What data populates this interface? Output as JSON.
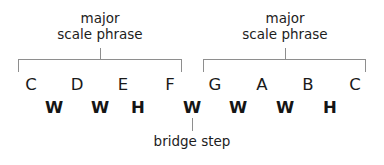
{
  "diagram": {
    "colors": {
      "text": "#1a1a1a",
      "line": "#8e8e8e",
      "background": "#ffffff"
    },
    "phrases": [
      {
        "id": "left-phrase",
        "line1": "major",
        "line2": "scale phrase",
        "center_x": 100,
        "bracket_left": 18,
        "bracket_right": 182
      },
      {
        "id": "right-phrase",
        "line1": "major",
        "line2": "scale phrase",
        "center_x": 285,
        "bracket_left": 203,
        "bracket_right": 366
      }
    ],
    "notes": [
      {
        "label": "C",
        "x": 31
      },
      {
        "label": "D",
        "x": 77
      },
      {
        "label": "E",
        "x": 123
      },
      {
        "label": "F",
        "x": 170
      },
      {
        "label": "G",
        "x": 215
      },
      {
        "label": "A",
        "x": 262
      },
      {
        "label": "B",
        "x": 308
      },
      {
        "label": "C",
        "x": 355
      }
    ],
    "steps": [
      {
        "label": "W",
        "x": 54,
        "bridge": false
      },
      {
        "label": "W",
        "x": 100,
        "bridge": false
      },
      {
        "label": "H",
        "x": 138,
        "bridge": false
      },
      {
        "label": "W",
        "x": 192,
        "bridge": true
      },
      {
        "label": "W",
        "x": 238,
        "bridge": false
      },
      {
        "label": "W",
        "x": 285,
        "bridge": false
      },
      {
        "label": "H",
        "x": 330,
        "bridge": false
      }
    ],
    "bridge": {
      "caption": "bridge step",
      "x": 192
    }
  }
}
